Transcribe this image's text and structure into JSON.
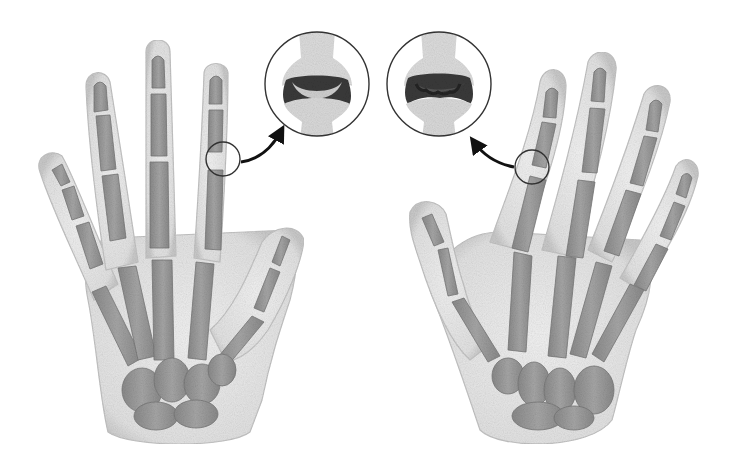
{
  "figure": {
    "subject": "Comparison of healthy hand vs arthritic hand skeleton with magnified finger joints",
    "panels": [
      {
        "id": "healthy-hand",
        "description": "Healthy hand (palm view, fingers straight) with magnified normal PIP joint showing smooth cartilage gap"
      },
      {
        "id": "arthritic-hand",
        "description": "Arthritic hand (fingers deviated, deformed joints) with magnified damaged joint showing irregular narrowed cartilage"
      }
    ],
    "insets": [
      {
        "id": "healthy-joint-zoom",
        "state": "normal joint"
      },
      {
        "id": "arthritic-joint-zoom",
        "state": "damaged joint"
      }
    ],
    "colors": {
      "background": "#ffffff",
      "skin": "#e9e9e9",
      "skin_edge": "#bdbdbd",
      "bone": "#9a9a9a",
      "bone_dark": "#7d7d7d",
      "cartilage_dark": "#3a3a3a",
      "outline": "#333333",
      "arrow": "#111111"
    }
  }
}
